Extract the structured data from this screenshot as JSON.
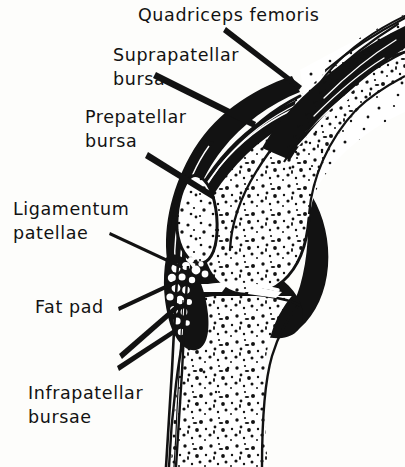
{
  "figure": {
    "kind": "anatomical-line-drawing",
    "style": "black-and-white stippled engraving",
    "background_color": "#fdfdfb",
    "ink_color": "#121212",
    "width": 405,
    "height": 467
  },
  "labels": [
    {
      "id": "quadriceps-femoris",
      "text": "Quadriceps femoris",
      "lines": [
        "Quadriceps femoris"
      ],
      "x": 138,
      "y": 21,
      "leader": {
        "from_x": 228,
        "from_y": 29,
        "to_x": 300,
        "to_y": 85,
        "style": "tapered-wedge"
      }
    },
    {
      "id": "suprapatellar-bursa",
      "text": "Suprapatellar bursa",
      "lines": [
        "Suprapatellar",
        "bursa"
      ],
      "x": 113,
      "y": 61,
      "leader": {
        "from_x": 158,
        "from_y": 75,
        "to_x": 254,
        "to_y": 124,
        "style": "tapered-wedge"
      }
    },
    {
      "id": "prepatellar-bursa",
      "text": "Prepatellar bursa",
      "lines": [
        "Prepatellar",
        "bursa"
      ],
      "x": 85,
      "y": 123,
      "leader": {
        "from_x": 150,
        "from_y": 155,
        "to_x": 213,
        "to_y": 196,
        "style": "tapered-wedge"
      }
    },
    {
      "id": "ligamentum-patellae",
      "text": "Ligamentum patellae",
      "lines": [
        "Ligamentum",
        "patellae"
      ],
      "x": 13,
      "y": 215,
      "leader": {
        "from_x": 112,
        "from_y": 234,
        "to_x": 182,
        "to_y": 268,
        "style": "thin"
      }
    },
    {
      "id": "fat-pad",
      "text": "Fat pad",
      "lines": [
        "Fat pad"
      ],
      "x": 35,
      "y": 313,
      "leader": {
        "from_x": 120,
        "from_y": 304,
        "to_x": 176,
        "to_y": 281,
        "style": "tapered-wedge"
      }
    },
    {
      "id": "infrapatellar-bursae",
      "text": "Infrapatellar bursae",
      "lines": [
        "Infrapatellar",
        "bursae"
      ],
      "x": 28,
      "y": 399,
      "leader_a": {
        "from_x": 120,
        "from_y": 357,
        "to_x": 176,
        "to_y": 306,
        "style": "tapered-wedge"
      },
      "leader_b": {
        "from_x": 118,
        "from_y": 369,
        "to_x": 172,
        "to_y": 332,
        "style": "tapered-wedge"
      }
    }
  ],
  "structures": [
    {
      "id": "femur",
      "name": "Femur with condyle",
      "fill": "stippled-cancellous-bone"
    },
    {
      "id": "patella",
      "name": "Patella",
      "fill": "stippled-cancellous-bone"
    },
    {
      "id": "tibia",
      "name": "Tibia",
      "fill": "stippled-cancellous-bone"
    },
    {
      "id": "quadriceps-tendon",
      "name": "Quadriceps tendon fibres",
      "fill": "solid-black-striated"
    },
    {
      "id": "synovial-cavity",
      "name": "Synovial cavity and bursae",
      "fill": "solid-black"
    },
    {
      "id": "infrapatellar-fat-pad",
      "name": "Infrapatellar fat pad",
      "fill": "lobulated-white-on-black"
    },
    {
      "id": "patellar-ligament",
      "name": "Ligamentum patellae band",
      "fill": "outline"
    },
    {
      "id": "menisci",
      "name": "Menisci / articular cartilage",
      "fill": "white-line"
    }
  ]
}
